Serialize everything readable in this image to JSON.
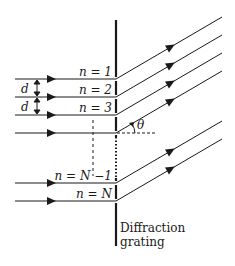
{
  "diagram": {
    "type": "diffraction-grating",
    "slit_labels": [
      "n = 1",
      "n = 2",
      "n = 3",
      "n = N −1",
      "n = N"
    ],
    "spacing_labels": [
      "d",
      "d"
    ],
    "angle_label": "θ",
    "caption_line1": "Diffraction",
    "caption_line2": "grating",
    "colors": {
      "line": "#1a1a1a",
      "background": "#ffffff"
    }
  }
}
